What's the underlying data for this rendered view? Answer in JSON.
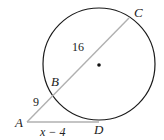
{
  "diagram": {
    "type": "secant-tangent circle geometry",
    "points": {
      "A": {
        "label": "A"
      },
      "B": {
        "label": "B"
      },
      "C": {
        "label": "C"
      },
      "D": {
        "label": "D"
      }
    },
    "segments": {
      "AB": {
        "label": "9"
      },
      "BC": {
        "label": "16"
      },
      "AD": {
        "label": "x − 4"
      }
    },
    "colors": {
      "circle": "#1a1a1a",
      "secant": "#b0b0b0",
      "tangent": "#b0b0b0",
      "text": "#222222"
    }
  }
}
